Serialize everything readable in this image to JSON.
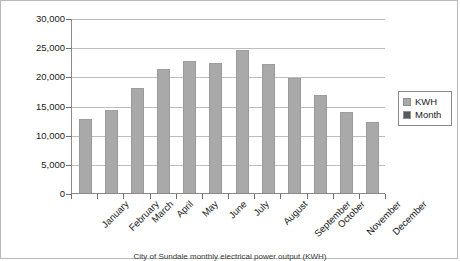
{
  "chart_data": {
    "type": "bar",
    "title": "",
    "xlabel": "",
    "ylabel": "",
    "ylim": [
      0,
      30000
    ],
    "ytick_values": [
      30000,
      25000,
      20000,
      15000,
      10000,
      5000,
      0
    ],
    "ytick_labels": [
      "30,000",
      "25,000",
      "20,000",
      "15,000",
      "10,000",
      "5,000",
      "0"
    ],
    "grid": true,
    "legend_position": "right",
    "categories": [
      "January",
      "February",
      "March",
      "April",
      "May",
      "June",
      "July",
      "August",
      "September",
      "October",
      "November",
      "December"
    ],
    "series": [
      {
        "name": "KWH",
        "values": [
          12700,
          14200,
          18000,
          21200,
          22600,
          22300,
          24500,
          22200,
          19800,
          16800,
          13900,
          12100
        ]
      },
      {
        "name": "Month",
        "values": [
          0,
          0,
          0,
          0,
          0,
          0,
          0,
          0,
          0,
          0,
          0,
          0
        ]
      }
    ]
  },
  "legend": {
    "entries": [
      {
        "label": "KWH",
        "color": "#a9a9a9"
      },
      {
        "label": "Month",
        "color": "#595959"
      }
    ]
  },
  "caption": {
    "text": "City of Sundale monthly electrical power output (KWH)"
  },
  "colors": {
    "bar_fill": "#a9a9a9",
    "gridline": "#bdbdbd",
    "axis": "#8a8a8a",
    "text": "#1a1a1a",
    "background": "#ffffff"
  }
}
